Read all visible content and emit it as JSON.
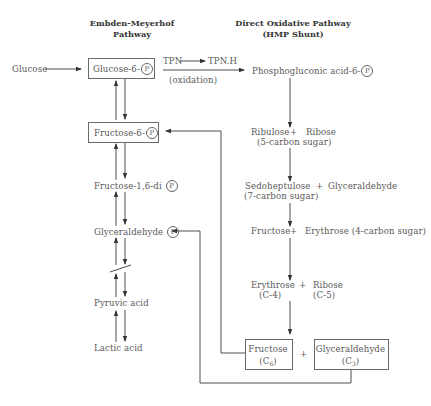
{
  "headers": {
    "left": {
      "line1": "Embden-Meyerhof",
      "line2": "Pathway"
    },
    "right": {
      "line1": "Direct Oxidative Pathway",
      "line2": "(HMP Shunt)"
    }
  },
  "phosphate_symbol": "P",
  "left_pathway": {
    "input": "Glucose",
    "glucose_6p": "Glucose-6-",
    "fructose_6p": "Fructose-6-",
    "fructose_16dip": "Fructose-1,6-di",
    "glyceraldehyde_p": "Glyceraldehyde",
    "pyruvic_acid": "Pyruvic acid",
    "lactic_acid": "Lactic acid"
  },
  "oxidation_step": {
    "tpn": "TPN",
    "tpnh": "TPN.H",
    "label": "(oxidation)"
  },
  "right_pathway": {
    "phosphogluconic": "Phosphogluconic acid-6-",
    "step1": {
      "a": "Ribulose",
      "plus": "+",
      "b": "Ribose",
      "note": "(5-carbon sugar)"
    },
    "step2": {
      "a": "Sedoheptulose",
      "plus": "+",
      "b": "Glyceraldehyde",
      "note": "(7-carbon sugar)"
    },
    "step3": {
      "a": "Fructose",
      "plus": "+",
      "b": "Erythrose (4-carbon sugar)"
    },
    "step4": {
      "a": "Erythrose",
      "a_note": "(C-4)",
      "plus": "+",
      "b": "Ribose",
      "b_note": "(C-5)"
    },
    "final": {
      "a": "Fructose",
      "a_note_prefix": "(C",
      "a_sub": "6",
      "a_note_suffix": ")",
      "plus": "+",
      "b": "Glyceraldehyde",
      "b_note_prefix": "(C",
      "b_sub": "3",
      "b_note_suffix": ")"
    }
  },
  "colors": {
    "line": "#3a3a3a",
    "text": "#5a5a5a",
    "header": "#333333",
    "background": "#ffffff"
  }
}
